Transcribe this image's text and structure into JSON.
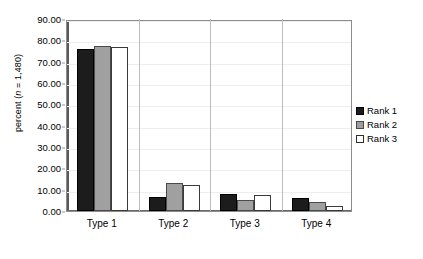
{
  "chart_data": {
    "type": "bar",
    "title": "",
    "subtitle": "",
    "xlabel": "",
    "ylabel": "percent (n = 1,480)",
    "ylabel_prefix": "percent (",
    "ylabel_italic": "n",
    "ylabel_suffix": " = 1,480)",
    "categories": [
      "Type 1",
      "Type 2",
      "Type 3",
      "Type 4"
    ],
    "series": [
      {
        "name": "Rank 1",
        "color": "#1c1c1c",
        "values": [
          76.0,
          6.5,
          8.0,
          6.0
        ]
      },
      {
        "name": "Rank 2",
        "color": "#a0a0a0",
        "values": [
          77.5,
          13.0,
          5.0,
          4.0
        ]
      },
      {
        "name": "Rank 3",
        "color": "#ffffff",
        "values": [
          77.0,
          12.0,
          7.5,
          2.5
        ]
      }
    ],
    "ylim": [
      0,
      90
    ],
    "yticks": [
      0,
      10,
      20,
      30,
      40,
      50,
      60,
      70,
      80,
      90
    ],
    "ytick_labels": [
      "0.00",
      "10.00",
      "20.00",
      "30.00",
      "40.00",
      "50.00",
      "60.00",
      "70.00",
      "80.00",
      "90.00"
    ],
    "grid": true,
    "grid_color": "#eeeeee",
    "legend_position": "right",
    "legend_entries": [
      "Rank 1",
      "Rank 2",
      "Rank 3"
    ],
    "plot_border_color": "#8c8c8c",
    "background": "#ffffff"
  }
}
